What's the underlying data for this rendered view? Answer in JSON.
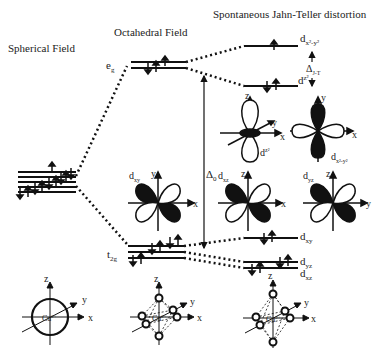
{
  "titles": {
    "spherical": "Spherical Field",
    "octahedral": "Octahedral Field",
    "jahn_teller": "Spontaneous Jahn-Teller distortion"
  },
  "levels": {
    "eg": "e",
    "eg_sub": "g",
    "t2g": "t",
    "t2g_sub": "2g",
    "dx2y2": "d",
    "dx2y2_sub": "x²-y²",
    "dz2": "d",
    "dz2_sub": "z²",
    "dxy": "d",
    "dxy_sub": "xy",
    "dyz": "d",
    "dyz_sub": "yz",
    "dxz": "d",
    "dxz_sub": "xz"
  },
  "gaps": {
    "delta0": "Δ",
    "delta0_sub": "0",
    "deltaJT": "Δ",
    "deltaJT_sub": "J-T"
  },
  "orbitals": [
    {
      "name": "d",
      "sub": "z²",
      "axes": [
        "z",
        "y",
        "x"
      ]
    },
    {
      "name": "d",
      "sub": "x²-y²",
      "axes": [
        "y",
        "x"
      ]
    },
    {
      "name": "d",
      "sub": "xy",
      "axes": [
        "y",
        "x"
      ]
    },
    {
      "name": "d",
      "sub": "xz",
      "axes": [
        "z",
        "x"
      ]
    },
    {
      "name": "d",
      "sub": "yz",
      "axes": [
        "z",
        "y"
      ]
    }
  ],
  "geometries": [
    {
      "center": "Cu",
      "sup": "2+",
      "axes": [
        "z",
        "y",
        "x"
      ],
      "type": "sphere"
    },
    {
      "center": "Cu",
      "sup": "2+",
      "axes": [
        "z",
        "y",
        "x"
      ],
      "type": "octahedron"
    },
    {
      "center": "Cu",
      "sup": "2+",
      "axes": [
        "z",
        "y",
        "x"
      ],
      "type": "elongated-octahedron"
    }
  ]
}
